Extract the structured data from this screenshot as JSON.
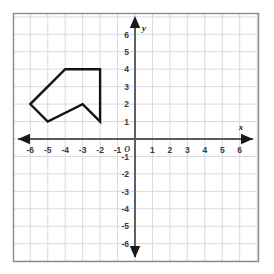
{
  "figure": {
    "title": "",
    "background_color": "#ffffff",
    "frame_color": "#8a8a8a",
    "grid_color": "#d9d9e2",
    "axis_color": "#5a5a5a",
    "shape_color": "#141414"
  },
  "axes": {
    "x_label": "x",
    "y_label": "y",
    "origin_label": "O",
    "x_ticks": [
      "-6",
      "-5",
      "-4",
      "-3",
      "-2",
      "-1",
      "1",
      "2",
      "3",
      "4",
      "5",
      "6"
    ],
    "y_ticks": [
      "6",
      "5",
      "4",
      "3",
      "2",
      "1",
      "-1",
      "-2",
      "-3",
      "-4",
      "-5",
      "-6"
    ],
    "x_tick_values": [
      -6,
      -5,
      -4,
      -3,
      -2,
      -1,
      1,
      2,
      3,
      4,
      5,
      6
    ],
    "y_tick_values": [
      6,
      5,
      4,
      3,
      2,
      1,
      -1,
      -2,
      -3,
      -4,
      -5,
      -6
    ],
    "xlim": [
      -7,
      7
    ],
    "ylim": [
      -7,
      7
    ],
    "grid": true,
    "arrows": [
      "left",
      "right",
      "up",
      "down"
    ]
  },
  "chart_data": {
    "type": "scatter",
    "title": "",
    "xlabel": "x",
    "ylabel": "y",
    "xlim": [
      -7,
      7
    ],
    "ylim": [
      -7,
      7
    ],
    "grid": true,
    "legend": "none",
    "shapes": [
      {
        "name": "polygon",
        "kind": "closed-polygon",
        "vertices": [
          [
            -4,
            4
          ],
          [
            -2,
            4
          ],
          [
            -2,
            1
          ],
          [
            -3,
            2
          ],
          [
            -5,
            1
          ],
          [
            -6,
            2
          ]
        ],
        "vertex_count": 6,
        "stroke": "#141414",
        "stroke_width": 2.4,
        "fill": "none"
      }
    ]
  }
}
